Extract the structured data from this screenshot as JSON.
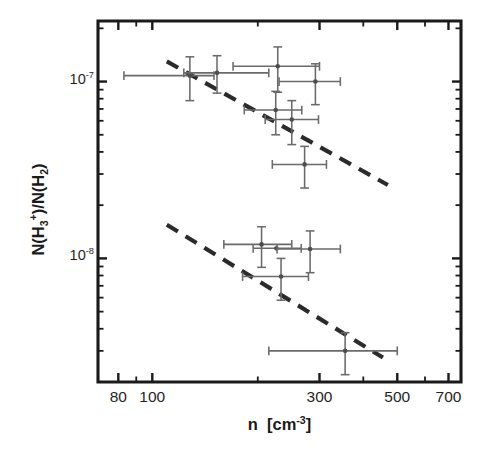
{
  "chart_data": {
    "type": "scatter",
    "title": "",
    "xlabel": "n  [cm-3]",
    "ylabel": "N(H3+)/N(H2)",
    "xscale": "log",
    "yscale": "log",
    "xlim": [
      70,
      760
    ],
    "ylim": [
      2e-09,
      2.2e-07
    ],
    "grid": false,
    "legend": null,
    "xticks": [
      80,
      100,
      300,
      500,
      700
    ],
    "xtick_labels": [
      "80",
      "100",
      "300",
      "500",
      "700"
    ],
    "yticks": [
      1e-07,
      1e-08
    ],
    "ytick_labels": [
      "10-7",
      "10-8"
    ],
    "series": [
      {
        "name": "upper-branch",
        "marker": "point-with-errorbars",
        "points": [
          {
            "x": 128,
            "y": 1.08e-07,
            "xerr_low": 45,
            "xerr_high": 22,
            "yerr_low": 3e-08,
            "yerr_high": 3e-08
          },
          {
            "x": 153,
            "y": 1.12e-07,
            "xerr_low": 30,
            "xerr_high": 62,
            "yerr_low": 2.6e-08,
            "yerr_high": 2.8e-08
          },
          {
            "x": 228,
            "y": 1.22e-07,
            "xerr_low": 58,
            "xerr_high": 72,
            "yerr_low": 3.5e-08,
            "yerr_high": 3.5e-08
          },
          {
            "x": 292,
            "y": 1e-07,
            "xerr_low": 62,
            "xerr_high": 52,
            "yerr_low": 2.6e-08,
            "yerr_high": 2.6e-08
          },
          {
            "x": 225,
            "y": 6.9e-08,
            "xerr_low": 42,
            "xerr_high": 42,
            "yerr_low": 1.9e-08,
            "yerr_high": 1.9e-08
          },
          {
            "x": 250,
            "y": 6.1e-08,
            "xerr_low": 40,
            "xerr_high": 48,
            "yerr_low": 1.7e-08,
            "yerr_high": 1.7e-08
          },
          {
            "x": 272,
            "y": 3.4e-08,
            "xerr_low": 52,
            "xerr_high": 42,
            "yerr_low": 9e-09,
            "yerr_high": 9e-09
          }
        ]
      },
      {
        "name": "lower-branch",
        "marker": "point-with-errorbars",
        "points": [
          {
            "x": 205,
            "y": 1.2e-08,
            "xerr_low": 45,
            "xerr_high": 45,
            "yerr_low": 3.1e-09,
            "yerr_high": 3.1e-09
          },
          {
            "x": 226,
            "y": 1.14e-08,
            "xerr_low": 32,
            "xerr_high": 40,
            "yerr_low": 0.0,
            "yerr_high": 0.0
          },
          {
            "x": 282,
            "y": 1.13e-08,
            "xerr_low": 55,
            "xerr_high": 62,
            "yerr_low": 3e-09,
            "yerr_high": 3e-09
          },
          {
            "x": 233,
            "y": 7.9e-09,
            "xerr_low": 52,
            "xerr_high": 46,
            "yerr_low": 2.1e-09,
            "yerr_high": 2.1e-09
          },
          {
            "x": 355,
            "y": 3e-09,
            "xerr_low": 140,
            "xerr_high": 145,
            "yerr_low": 8e-10,
            "yerr_high": 8e-10
          }
        ]
      }
    ],
    "trend_lines": [
      {
        "name": "upper-dashed-trend",
        "style": "dashed",
        "x0": 110,
        "y0": 1.3e-07,
        "x1": 470,
        "y1": 2.6e-08
      },
      {
        "name": "lower-dashed-trend",
        "style": "dashed",
        "x0": 110,
        "y0": 1.55e-08,
        "x1": 455,
        "y1": 2.75e-09
      }
    ],
    "colors": {
      "axis": "#1a1a1a",
      "marker": "#4d4d4d",
      "errorbar": "#6a6a6a",
      "trend": "#2b2b2b",
      "background": "#ffffff"
    }
  },
  "axis_text": {
    "ylabel_prefix": "N(H",
    "ylabel_sub3": "3",
    "ylabel_sup_plus": "+",
    "ylabel_mid": ")/N(H",
    "ylabel_sub2": "2",
    "ylabel_suffix": ")",
    "xlabel_n": "n",
    "xlabel_bracket_open": "[cm",
    "xlabel_exp": "-3",
    "xlabel_bracket_close": "]",
    "ytick_10_base": "10",
    "ytick_exp_7": "-7",
    "ytick_exp_8": "-8",
    "xtick_80": "80",
    "xtick_100": "100",
    "xtick_300": "300",
    "xtick_500": "500",
    "xtick_700": "700"
  }
}
